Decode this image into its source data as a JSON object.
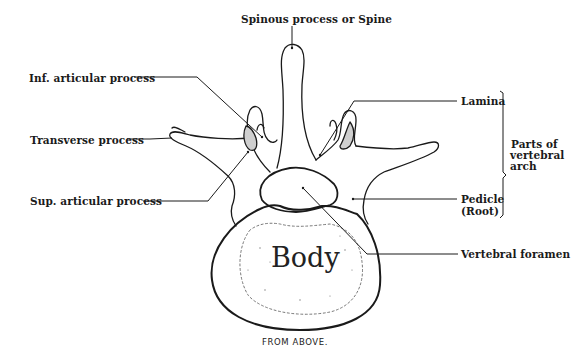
{
  "diagram": {
    "view_caption": "FROM ABOVE.",
    "body_label": "Body",
    "labels": {
      "spinous": "Spinous process or Spine",
      "inf_articular": "Inf. articular process",
      "transverse": "Transverse process",
      "sup_articular": "Sup. articular process",
      "lamina": "Lamina",
      "pedicle_line1": "Pedicle",
      "pedicle_line2": "(Root)",
      "vertebral_foramen": "Vertebral foramen",
      "arch_group_line1": "Parts of",
      "arch_group_line2": "vertebral",
      "arch_group_line3": "arch"
    },
    "colors": {
      "ink": "#1a1a1a",
      "facet_shading": "#cfcfcf",
      "background": "#ffffff"
    }
  }
}
